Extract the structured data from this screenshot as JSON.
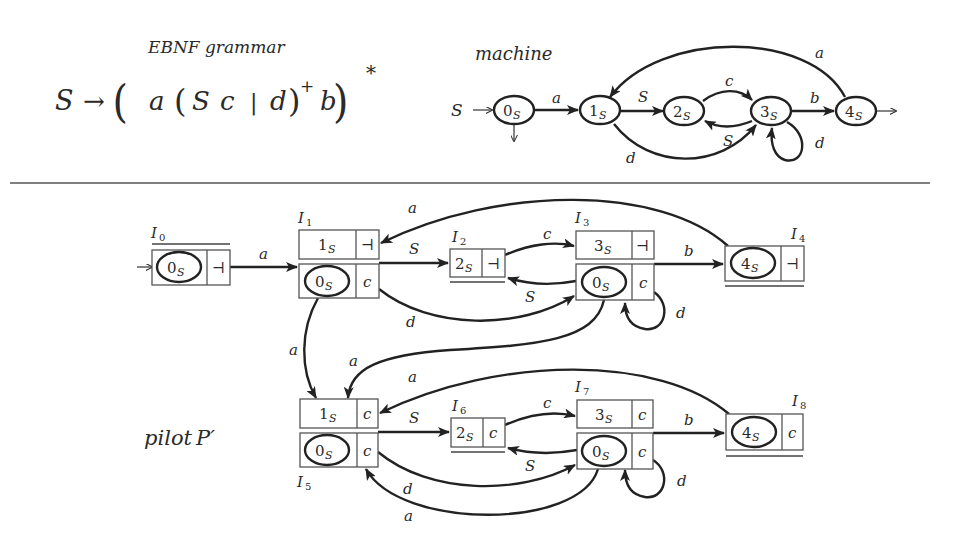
{
  "grammar": {
    "title": "EBNF grammar",
    "lhs": "S",
    "arrow": "→",
    "rule_parts": [
      "(",
      "a",
      "(",
      "S",
      "c",
      "|",
      "d",
      ")",
      "+",
      "b",
      ")",
      "*"
    ]
  },
  "machine": {
    "title": "machine",
    "initial_label": "S",
    "states": [
      {
        "id": "0S",
        "num": "0",
        "sub": "S",
        "initial": true,
        "final": true
      },
      {
        "id": "1S",
        "num": "1",
        "sub": "S"
      },
      {
        "id": "2S",
        "num": "2",
        "sub": "S"
      },
      {
        "id": "3S",
        "num": "3",
        "sub": "S"
      },
      {
        "id": "4S",
        "num": "4",
        "sub": "S",
        "final": true
      }
    ],
    "transitions": [
      {
        "from": "0S",
        "to": "1S",
        "label": "a"
      },
      {
        "from": "1S",
        "to": "2S",
        "label": "S"
      },
      {
        "from": "2S",
        "to": "3S",
        "label": "c"
      },
      {
        "from": "3S",
        "to": "2S",
        "label": "S"
      },
      {
        "from": "1S",
        "to": "3S",
        "label": "d"
      },
      {
        "from": "3S",
        "to": "3S",
        "label": "d"
      },
      {
        "from": "3S",
        "to": "4S",
        "label": "b"
      },
      {
        "from": "4S",
        "to": "1S",
        "label": "a"
      }
    ]
  },
  "pilot": {
    "title": "pilot",
    "symbol": "P′",
    "lookahead_end": "⊣",
    "m_states": [
      {
        "id": "I0",
        "label": "I",
        "sub": "0",
        "rows": [
          {
            "state": "0",
            "sub": "S",
            "la": "⊣",
            "circled": true
          }
        ]
      },
      {
        "id": "I1",
        "label": "I",
        "sub": "1",
        "rows": [
          {
            "state": "1",
            "sub": "S",
            "la": "⊣"
          },
          {
            "state": "0",
            "sub": "S",
            "la": "c",
            "circled": true
          }
        ]
      },
      {
        "id": "I2",
        "label": "I",
        "sub": "2",
        "rows": [
          {
            "state": "2",
            "sub": "S",
            "la": "⊣"
          }
        ]
      },
      {
        "id": "I3",
        "label": "I",
        "sub": "3",
        "rows": [
          {
            "state": "3",
            "sub": "S",
            "la": "⊣"
          },
          {
            "state": "0",
            "sub": "S",
            "la": "c",
            "circled": true
          }
        ]
      },
      {
        "id": "I4",
        "label": "I",
        "sub": "4",
        "rows": [
          {
            "state": "4",
            "sub": "S",
            "la": "⊣",
            "circled": true
          }
        ]
      },
      {
        "id": "I5",
        "label": "I",
        "sub": "5",
        "rows": [
          {
            "state": "1",
            "sub": "S",
            "la": "c"
          },
          {
            "state": "0",
            "sub": "S",
            "la": "c",
            "circled": true
          }
        ]
      },
      {
        "id": "I6",
        "label": "I",
        "sub": "6",
        "rows": [
          {
            "state": "2",
            "sub": "S",
            "la": "c"
          }
        ]
      },
      {
        "id": "I7",
        "label": "I",
        "sub": "7",
        "rows": [
          {
            "state": "3",
            "sub": "S",
            "la": "c"
          },
          {
            "state": "0",
            "sub": "S",
            "la": "c",
            "circled": true
          }
        ]
      },
      {
        "id": "I8",
        "label": "I",
        "sub": "8",
        "rows": [
          {
            "state": "4",
            "sub": "S",
            "la": "c",
            "circled": true
          }
        ]
      }
    ],
    "transitions": [
      {
        "from": "I0",
        "to": "I1",
        "label": "a"
      },
      {
        "from": "I1",
        "to": "I2",
        "label": "S"
      },
      {
        "from": "I2",
        "to": "I3",
        "label": "c"
      },
      {
        "from": "I3",
        "to": "I2",
        "label": "S"
      },
      {
        "from": "I1",
        "to": "I3",
        "label": "d"
      },
      {
        "from": "I3",
        "to": "I3",
        "label": "d"
      },
      {
        "from": "I3",
        "to": "I4",
        "label": "b"
      },
      {
        "from": "I4",
        "to": "I1",
        "label": "a"
      },
      {
        "from": "I1",
        "to": "I5",
        "label": "a"
      },
      {
        "from": "I3",
        "to": "I5",
        "label": "a"
      },
      {
        "from": "I5",
        "to": "I6",
        "label": "S"
      },
      {
        "from": "I6",
        "to": "I7",
        "label": "c"
      },
      {
        "from": "I7",
        "to": "I6",
        "label": "S"
      },
      {
        "from": "I5",
        "to": "I7",
        "label": "d"
      },
      {
        "from": "I7",
        "to": "I7",
        "label": "d"
      },
      {
        "from": "I7",
        "to": "I8",
        "label": "b"
      },
      {
        "from": "I8",
        "to": "I5",
        "label": "a"
      },
      {
        "from": "I7",
        "to": "I5",
        "label": "a"
      }
    ]
  },
  "labels": {
    "a": "a",
    "b": "b",
    "c": "c",
    "d": "d",
    "S": "S"
  }
}
